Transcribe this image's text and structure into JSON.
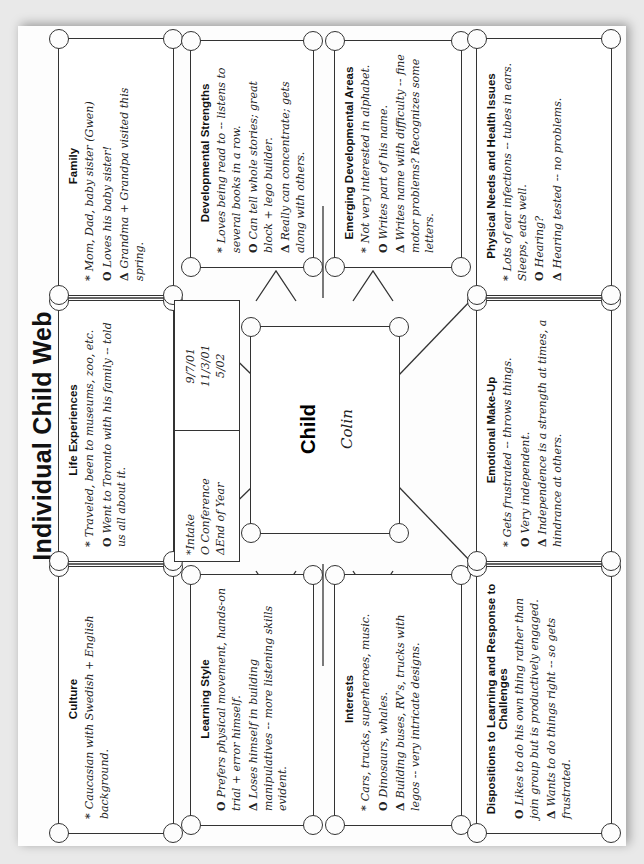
{
  "title": "Individual Child Web",
  "legend": {
    "items": [
      {
        "symbol": "*",
        "label": "Intake",
        "date": "9/7/01"
      },
      {
        "symbol": "O",
        "label": "Conference",
        "date": "11/3/01"
      },
      {
        "symbol": "Δ",
        "label": "End of Year",
        "date": "5/02"
      }
    ]
  },
  "child": {
    "heading": "Child",
    "name": "Colin"
  },
  "sections": {
    "culture": {
      "heading": "Culture",
      "notes": [
        {
          "symbol": "*",
          "text": "Caucasian with Swedish + English background."
        }
      ]
    },
    "life_experiences": {
      "heading": "Life Experiences",
      "notes": [
        {
          "symbol": "*",
          "text": "Traveled, been to museums, zoo, etc."
        },
        {
          "symbol": "O",
          "text": "Went to Toronto with his family -- told us all about it."
        }
      ]
    },
    "family": {
      "heading": "Family",
      "notes": [
        {
          "symbol": "*",
          "text": "Mom, Dad, baby sister (Gwen)"
        },
        {
          "symbol": "O",
          "text": "Loves his baby sister!"
        },
        {
          "symbol": "Δ",
          "text": "Grandma + Grandpa visited this spring."
        }
      ]
    },
    "learning_style": {
      "heading": "Learning Style",
      "notes": [
        {
          "symbol": "O",
          "text": "Prefers physical movement, hands-on trial + error himself."
        },
        {
          "symbol": "Δ",
          "text": "Loses himself in building manipulatives -- more listening skills evident."
        }
      ]
    },
    "developmental_strengths": {
      "heading": "Developmental Strengths",
      "notes": [
        {
          "symbol": "*",
          "text": "Loves being read to -- listens to several books in a row."
        },
        {
          "symbol": "O",
          "text": "Can tell whole stories; great block + lego builder."
        },
        {
          "symbol": "Δ",
          "text": "Really can concentrate; gets along with others."
        }
      ]
    },
    "interests": {
      "heading": "Interests",
      "notes": [
        {
          "symbol": "*",
          "text": "Cars, trucks, superheroes, music."
        },
        {
          "symbol": "O",
          "text": "Dinosaurs, whales."
        },
        {
          "symbol": "Δ",
          "text": "Building buses, RV's, trucks with legos -- very intricate designs."
        }
      ]
    },
    "emerging_developmental_areas": {
      "heading": "Emerging Developmental Areas",
      "notes": [
        {
          "symbol": "*",
          "text": "Not very interested in alphabet."
        },
        {
          "symbol": "O",
          "text": "Writes part of his name."
        },
        {
          "symbol": "Δ",
          "text": "Writes name with difficulty -- fine motor problems? Recognizes some letters."
        }
      ]
    },
    "dispositions": {
      "heading": "Dispositions to Learning and Response to Challenges",
      "notes": [
        {
          "symbol": "O",
          "text": "Likes to do his own thing rather than join group but is productively engaged."
        },
        {
          "symbol": "Δ",
          "text": "Wants to do things right -- so gets frustrated."
        }
      ]
    },
    "emotional_makeup": {
      "heading": "Emotional Make-Up",
      "notes": [
        {
          "symbol": "*",
          "text": "Gets frustrated -- throws things."
        },
        {
          "symbol": "O",
          "text": "Very independent."
        },
        {
          "symbol": "Δ",
          "text": "Independence is a strength at times, a hindrance at others."
        }
      ]
    },
    "physical_needs": {
      "heading": "Physical Needs and Health Issues",
      "notes": [
        {
          "symbol": "*",
          "text": "Lots of ear infections -- tubes in ears. Sleeps, eats well."
        },
        {
          "symbol": "O",
          "text": "Hearing?"
        },
        {
          "symbol": "Δ",
          "text": "Hearing tested -- no problems."
        }
      ]
    }
  }
}
